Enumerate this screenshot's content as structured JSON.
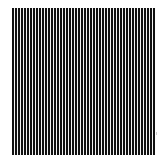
{
  "image": {
    "description": "Vertical black and white stripe grating pattern",
    "stripe_color": "#111111",
    "gap_color": "#f4f4f4",
    "background": "#ffffff",
    "stripe_pitch_px": 3,
    "label": "Vertical grating"
  }
}
